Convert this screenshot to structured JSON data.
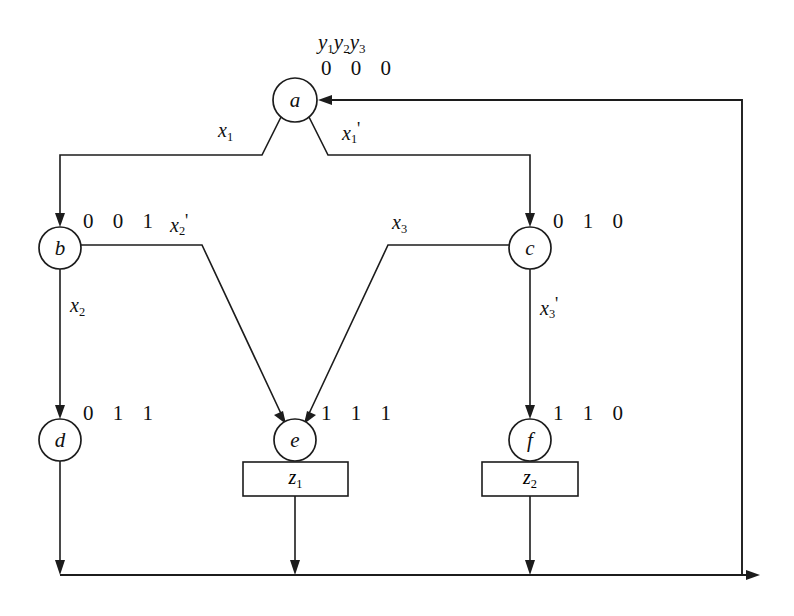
{
  "diagram": {
    "header": {
      "state_vars": "y1y2y3",
      "state_vars_plain": "y₁y₂y₃",
      "root_code": "0 0 0"
    },
    "nodes": [
      {
        "id": "a",
        "label": "a",
        "code": "0 0 0",
        "cx": 295,
        "cy": 100,
        "r": 22,
        "code_x": 318,
        "code_y": 55
      },
      {
        "id": "b",
        "label": "b",
        "code": "0 0 1",
        "cx": 60,
        "cy": 248,
        "r": 21,
        "code_x": 83,
        "code_y": 208
      },
      {
        "id": "c",
        "label": "c",
        "code": "0 1 0",
        "cx": 530,
        "cy": 248,
        "r": 21,
        "code_x": 553,
        "code_y": 208
      },
      {
        "id": "d",
        "label": "d",
        "code": "0 1 1",
        "cx": 60,
        "cy": 440,
        "r": 21,
        "code_x": 83,
        "code_y": 400
      },
      {
        "id": "e",
        "label": "e",
        "code": "1 1 1",
        "cx": 295,
        "cy": 440,
        "r": 21,
        "code_x": 318,
        "code_y": 400
      },
      {
        "id": "f",
        "label": "f",
        "code": "1 1 0",
        "cx": 530,
        "cy": 440,
        "r": 21,
        "code_x": 553,
        "code_y": 400
      }
    ],
    "edge_labels": [
      {
        "id": "x1",
        "base": "x",
        "sub": "1",
        "prime": false,
        "x": 218,
        "y": 120
      },
      {
        "id": "x1prime",
        "base": "x",
        "sub": "1",
        "prime": true,
        "x": 342,
        "y": 120
      },
      {
        "id": "x2",
        "base": "x",
        "sub": "2",
        "prime": false,
        "x": 70,
        "y": 295
      },
      {
        "id": "x2prime",
        "base": "x",
        "sub": "2",
        "prime": true,
        "x": 170,
        "y": 212
      },
      {
        "id": "x3",
        "base": "x",
        "sub": "3",
        "prime": false,
        "x": 392,
        "y": 212
      },
      {
        "id": "x3prime",
        "base": "x",
        "sub": "3",
        "prime": true,
        "x": 540,
        "y": 295
      }
    ],
    "outputs": [
      {
        "id": "z1",
        "base": "z",
        "sub": "1",
        "x": 243,
        "y": 462,
        "w": 105,
        "h": 34
      },
      {
        "id": "z2",
        "base": "z",
        "sub": "2",
        "x": 482,
        "y": 462,
        "w": 96,
        "h": 34
      }
    ],
    "colors": {
      "ink": "#1c1c1c",
      "background": "#ffffff",
      "text": "#101010"
    }
  }
}
